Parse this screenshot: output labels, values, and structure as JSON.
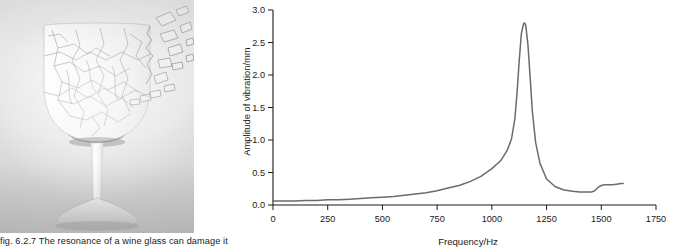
{
  "figure": {
    "caption": "fig. 6.2.7 The resonance of a wine glass can damage it",
    "photo_alt_name": "shattering-wine-glass-photo"
  },
  "chart_data": {
    "type": "line",
    "title": "",
    "xlabel": "Frequency/Hz",
    "ylabel": "Amplitude of vibration/mm",
    "xlim": [
      0,
      1750
    ],
    "ylim": [
      0.0,
      3.0
    ],
    "xticks": [
      0,
      250,
      500,
      750,
      1000,
      1250,
      1500,
      1750
    ],
    "xtick_labels": [
      "0",
      "250",
      "500",
      "750",
      "1000",
      "1250",
      "1500",
      "1750"
    ],
    "yticks": [
      0.0,
      0.5,
      1.0,
      1.5,
      2.0,
      2.5,
      3.0
    ],
    "ytick_labels": [
      "0.0",
      "0.5",
      "1.0",
      "1.5",
      "2.0",
      "2.5",
      "3.0"
    ],
    "grid": false,
    "legend": "none",
    "line_color": "#6b6b6b",
    "axis_color": "#1a1a1a",
    "resonant_peak_hz": 1150,
    "resonant_peak_amplitude_mm": 2.8,
    "secondary_bump_hz": 1500,
    "secondary_bump_amplitude_mm": 0.3,
    "series": [
      {
        "name": "Amplitude of vibration",
        "x": [
          0,
          50,
          100,
          150,
          200,
          250,
          300,
          350,
          400,
          450,
          500,
          550,
          600,
          650,
          700,
          750,
          800,
          850,
          900,
          950,
          1000,
          1040,
          1070,
          1090,
          1105,
          1115,
          1125,
          1135,
          1145,
          1150,
          1155,
          1165,
          1175,
          1185,
          1200,
          1220,
          1250,
          1290,
          1330,
          1370,
          1400,
          1430,
          1455,
          1470,
          1485,
          1500,
          1515,
          1530,
          1550,
          1570,
          1590,
          1600
        ],
        "values": [
          0.06,
          0.06,
          0.06,
          0.07,
          0.07,
          0.08,
          0.08,
          0.09,
          0.1,
          0.11,
          0.12,
          0.13,
          0.15,
          0.17,
          0.19,
          0.22,
          0.26,
          0.3,
          0.36,
          0.44,
          0.56,
          0.68,
          0.84,
          1.02,
          1.32,
          1.72,
          2.22,
          2.64,
          2.79,
          2.8,
          2.76,
          2.46,
          1.96,
          1.44,
          0.96,
          0.64,
          0.4,
          0.28,
          0.23,
          0.21,
          0.2,
          0.2,
          0.2,
          0.22,
          0.27,
          0.3,
          0.31,
          0.31,
          0.31,
          0.32,
          0.33,
          0.33
        ]
      }
    ]
  }
}
